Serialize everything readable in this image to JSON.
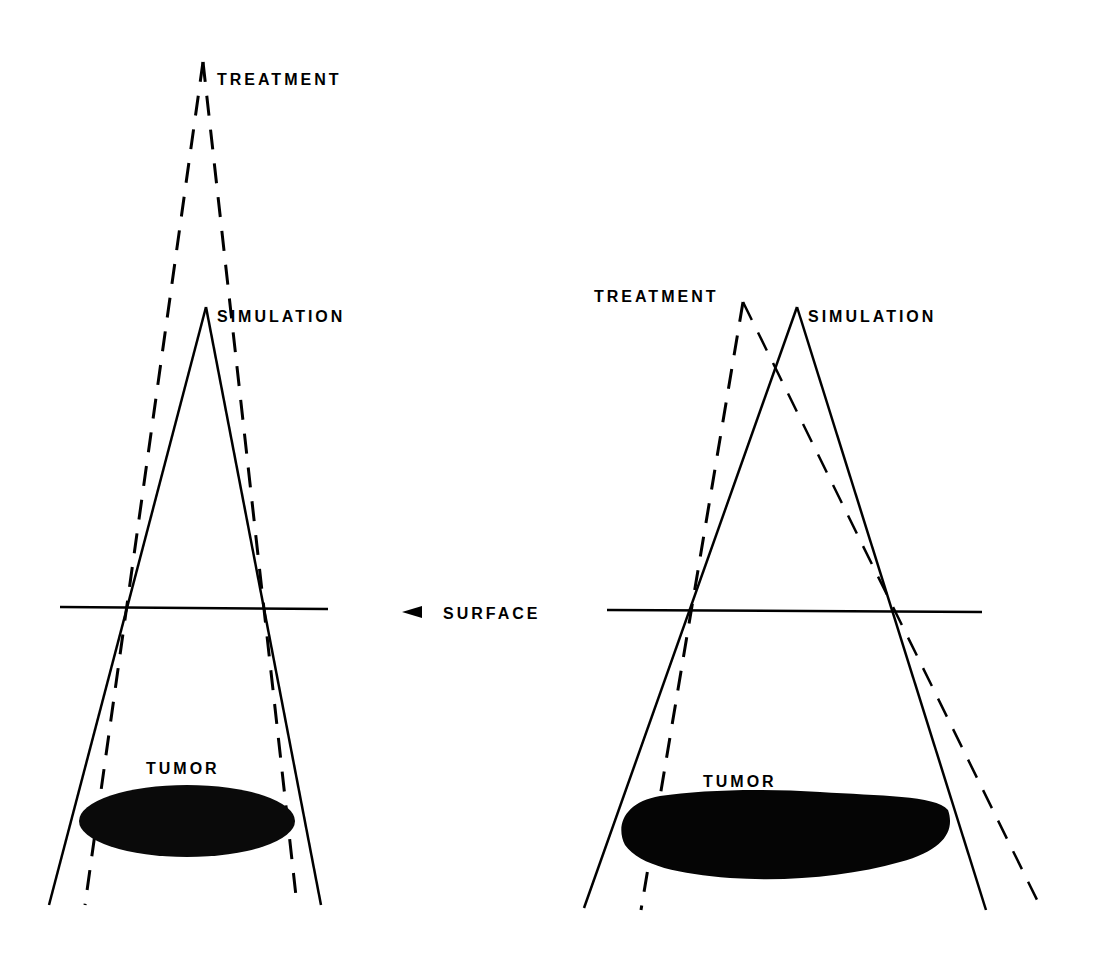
{
  "figure": {
    "colors": {
      "ink": "#000000",
      "background": "#ffffff"
    },
    "shared_labels": {
      "surface": "SURFACE"
    },
    "left_panel": {
      "treatment_label": "TREATMENT",
      "simulation_label": "SIMULATION",
      "tumor_label": "TUMOR",
      "treatment_source": [
        203,
        62
      ],
      "simulation_source": [
        206,
        307
      ],
      "treatment_beam_style": "dashed",
      "simulation_beam_style": "solid"
    },
    "right_panel": {
      "treatment_label": "TREATMENT",
      "simulation_label": "SIMULATION",
      "tumor_label": "TUMOR",
      "treatment_source": [
        743,
        302
      ],
      "simulation_source": [
        797,
        307
      ],
      "treatment_beam_style": "dashed",
      "simulation_beam_style": "solid"
    }
  }
}
